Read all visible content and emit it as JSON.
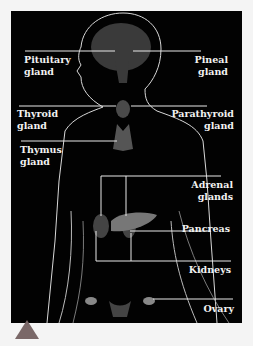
{
  "diagram": {
    "type": "labeled anatomical diagram",
    "background_color": "#020202",
    "label_color": "#f2f2f2",
    "labels": [
      {
        "id": "pituitary",
        "lines": [
          "Pituitary",
          "gland"
        ],
        "side": "left"
      },
      {
        "id": "pineal",
        "lines": [
          "Pineal",
          "gland"
        ],
        "side": "right"
      },
      {
        "id": "thyroid",
        "lines": [
          "Thyroid",
          "gland"
        ],
        "side": "left"
      },
      {
        "id": "parathyroid",
        "lines": [
          "Parathyroid",
          "gland"
        ],
        "side": "right"
      },
      {
        "id": "thymus",
        "lines": [
          "Thymus",
          "gland"
        ],
        "side": "left"
      },
      {
        "id": "adrenal",
        "lines": [
          "Adrenal",
          "glands"
        ],
        "side": "right"
      },
      {
        "id": "pancreas",
        "lines": [
          "Pancreas"
        ],
        "side": "right"
      },
      {
        "id": "kidneys",
        "lines": [
          "Kidneys"
        ],
        "side": "right"
      },
      {
        "id": "ovary",
        "lines": [
          "Ovary"
        ],
        "side": "right"
      }
    ],
    "marker": {
      "shape": "triangle",
      "color": "#7a6868"
    }
  }
}
